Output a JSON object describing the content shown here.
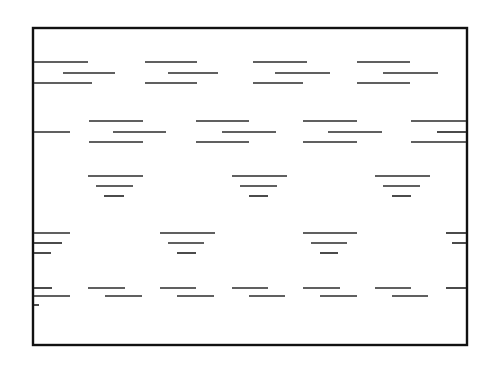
{
  "figure": {
    "canvas": {
      "width": 498,
      "height": 369
    },
    "colors": {
      "background": "#ffffff",
      "frame_stroke": "#111111",
      "mark_stroke": "#2b2b2b"
    },
    "frame": {
      "x": 33,
      "y": 28,
      "width": 434,
      "height": 317,
      "stroke_width": 2.4
    },
    "mark_stroke_width": 1.7,
    "bands": [
      {
        "name": "band-1",
        "marks": [
          {
            "x1": 34,
            "x2": 88,
            "y": 62
          },
          {
            "x1": 63,
            "x2": 115,
            "y": 73
          },
          {
            "x1": 34,
            "x2": 92,
            "y": 83
          },
          {
            "x1": 145,
            "x2": 197,
            "y": 62
          },
          {
            "x1": 168,
            "x2": 218,
            "y": 73
          },
          {
            "x1": 145,
            "x2": 197,
            "y": 83
          },
          {
            "x1": 253,
            "x2": 307,
            "y": 62
          },
          {
            "x1": 275,
            "x2": 330,
            "y": 73
          },
          {
            "x1": 253,
            "x2": 303,
            "y": 83
          },
          {
            "x1": 357,
            "x2": 410,
            "y": 62
          },
          {
            "x1": 383,
            "x2": 438,
            "y": 73
          },
          {
            "x1": 357,
            "x2": 410,
            "y": 83
          }
        ]
      },
      {
        "name": "band-2",
        "marks": [
          {
            "x1": 34,
            "x2": 70,
            "y": 132
          },
          {
            "x1": 89,
            "x2": 143,
            "y": 121
          },
          {
            "x1": 113,
            "x2": 166,
            "y": 132
          },
          {
            "x1": 89,
            "x2": 143,
            "y": 142
          },
          {
            "x1": 196,
            "x2": 249,
            "y": 121
          },
          {
            "x1": 222,
            "x2": 276,
            "y": 132
          },
          {
            "x1": 196,
            "x2": 249,
            "y": 142
          },
          {
            "x1": 303,
            "x2": 357,
            "y": 121
          },
          {
            "x1": 328,
            "x2": 382,
            "y": 132
          },
          {
            "x1": 303,
            "x2": 357,
            "y": 142
          },
          {
            "x1": 411,
            "x2": 466,
            "y": 121
          },
          {
            "x1": 437,
            "x2": 466,
            "y": 132
          },
          {
            "x1": 411,
            "x2": 466,
            "y": 142
          }
        ]
      },
      {
        "name": "band-3",
        "marks": [
          {
            "x1": 88,
            "x2": 143,
            "y": 176
          },
          {
            "x1": 96,
            "x2": 133,
            "y": 186
          },
          {
            "x1": 104,
            "x2": 124,
            "y": 196
          },
          {
            "x1": 232,
            "x2": 287,
            "y": 176
          },
          {
            "x1": 240,
            "x2": 277,
            "y": 186
          },
          {
            "x1": 249,
            "x2": 268,
            "y": 196
          },
          {
            "x1": 375,
            "x2": 430,
            "y": 176
          },
          {
            "x1": 383,
            "x2": 420,
            "y": 186
          },
          {
            "x1": 392,
            "x2": 411,
            "y": 196
          }
        ]
      },
      {
        "name": "band-4",
        "marks": [
          {
            "x1": 34,
            "x2": 70,
            "y": 233
          },
          {
            "x1": 34,
            "x2": 62,
            "y": 243
          },
          {
            "x1": 34,
            "x2": 51,
            "y": 253
          },
          {
            "x1": 160,
            "x2": 215,
            "y": 233
          },
          {
            "x1": 168,
            "x2": 204,
            "y": 243
          },
          {
            "x1": 177,
            "x2": 196,
            "y": 253
          },
          {
            "x1": 303,
            "x2": 357,
            "y": 233
          },
          {
            "x1": 311,
            "x2": 347,
            "y": 243
          },
          {
            "x1": 320,
            "x2": 338,
            "y": 253
          },
          {
            "x1": 446,
            "x2": 466,
            "y": 233
          },
          {
            "x1": 452,
            "x2": 466,
            "y": 243
          }
        ]
      },
      {
        "name": "band-5",
        "marks": [
          {
            "x1": 34,
            "x2": 52,
            "y": 288
          },
          {
            "x1": 34,
            "x2": 70,
            "y": 296
          },
          {
            "x1": 34,
            "x2": 39,
            "y": 305
          },
          {
            "x1": 88,
            "x2": 125,
            "y": 288
          },
          {
            "x1": 105,
            "x2": 142,
            "y": 296
          },
          {
            "x1": 160,
            "x2": 196,
            "y": 288
          },
          {
            "x1": 177,
            "x2": 214,
            "y": 296
          },
          {
            "x1": 232,
            "x2": 268,
            "y": 288
          },
          {
            "x1": 249,
            "x2": 285,
            "y": 296
          },
          {
            "x1": 303,
            "x2": 340,
            "y": 288
          },
          {
            "x1": 320,
            "x2": 357,
            "y": 296
          },
          {
            "x1": 375,
            "x2": 411,
            "y": 288
          },
          {
            "x1": 392,
            "x2": 428,
            "y": 296
          },
          {
            "x1": 446,
            "x2": 466,
            "y": 288
          }
        ]
      }
    ]
  }
}
